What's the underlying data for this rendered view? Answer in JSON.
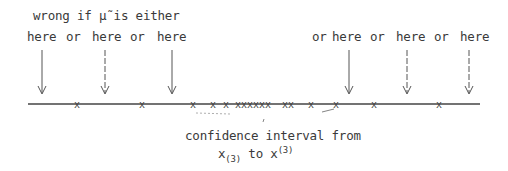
{
  "heading": "wrong if μ̃ is either",
  "labels": {
    "here1": "here",
    "or1": "or",
    "here2": "here",
    "or2": "or",
    "here3": "here",
    "or3": "or",
    "here4": "here",
    "or4": "or",
    "here5": "here",
    "or5": "or",
    "here6": "here"
  },
  "caption": {
    "line1": "confidence interval from",
    "x_lower": "x",
    "x_lower_sub": "(3)",
    "to": "to",
    "x_upper": "x",
    "x_upper_sup": "(3)"
  },
  "axis": {
    "x_start": 28,
    "x_end": 480,
    "y": 104
  },
  "arrows_x": [
    42,
    105,
    172,
    349,
    407,
    469
  ],
  "marks_x": [
    77,
    142,
    193,
    213,
    226,
    238,
    244,
    250,
    256,
    262,
    268,
    285,
    291,
    311,
    336,
    374,
    439
  ]
}
